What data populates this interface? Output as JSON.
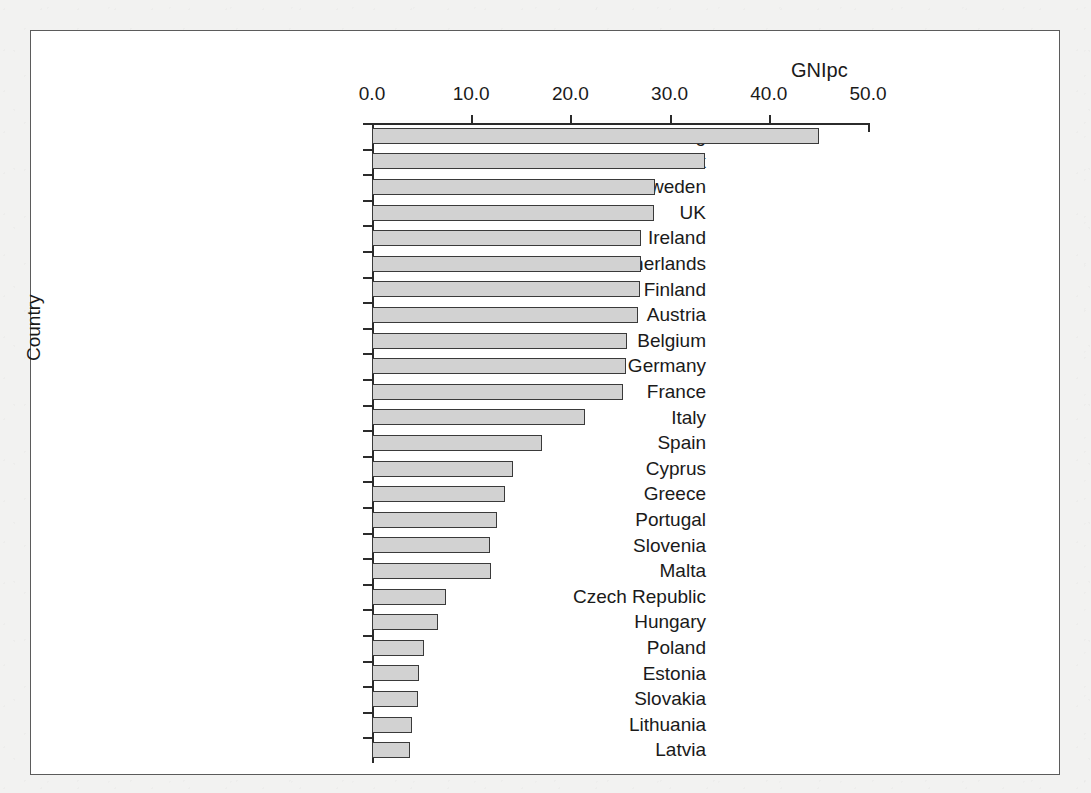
{
  "figure": {
    "title": "GNIpc",
    "y_axis_title": "Country"
  },
  "chart_data": {
    "type": "bar",
    "orientation": "horizontal",
    "title": "GNIpc",
    "xlabel": "GNIpc",
    "ylabel": "Country",
    "xlim": [
      0.0,
      50.0
    ],
    "xticks": [
      "0.0",
      "10.0",
      "20.0",
      "30.0",
      "40.0",
      "50.0"
    ],
    "xtick_values": [
      0.0,
      10.0,
      20.0,
      30.0,
      40.0,
      50.0
    ],
    "grid": false,
    "legend": null,
    "bar_fill_color": "#d2d2d2",
    "bar_edge_color": "#3a3a3a",
    "categories": [
      "Luxembourg",
      "Denmark",
      "Sweden",
      "UK",
      "Ireland",
      "Netherlands",
      "Finland",
      "Austria",
      "Belgium",
      "Germany",
      "France",
      "Italy",
      "Spain",
      "Cyprus",
      "Greece",
      "Portugal",
      "Slovenia",
      "Malta",
      "Czech Republic",
      "Hungary",
      "Poland",
      "Estonia",
      "Slovakia",
      "Lithuania",
      "Latvia"
    ],
    "values": [
      45.1,
      33.6,
      28.5,
      28.4,
      27.1,
      27.1,
      27.0,
      26.8,
      25.7,
      25.6,
      25.3,
      21.5,
      17.1,
      14.2,
      13.4,
      12.6,
      11.9,
      12.0,
      7.5,
      6.7,
      5.2,
      4.7,
      4.6,
      4.0,
      3.8
    ]
  }
}
